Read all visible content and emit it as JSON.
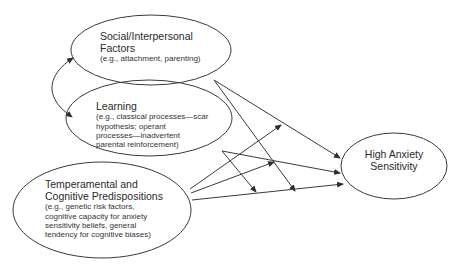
{
  "diagram": {
    "nodes": [
      {
        "id": "social",
        "title_lines": [
          "Social/Interpersonal",
          "Factors"
        ],
        "sub_lines": [
          "(e.g., attachment, parenting)"
        ]
      },
      {
        "id": "learning",
        "title_lines": [
          "Learning"
        ],
        "sub_lines": [
          "(e.g., classical processes—scar",
          "hypothesis; operant",
          "processes—inadvertent",
          "parental reinforcement)"
        ]
      },
      {
        "id": "temperamental",
        "title_lines": [
          "Temperamental and",
          "Cognitive Predispositions"
        ],
        "sub_lines": [
          "(e.g., genetic risk factors,",
          "cognitive capacity for anxiety",
          "sensitivity beliefs, general",
          "tendency for cognitive biases)"
        ]
      },
      {
        "id": "outcome",
        "title_lines": [
          "High Anxiety",
          "Sensitivity"
        ],
        "sub_lines": []
      }
    ],
    "edges": [
      {
        "from": "learning",
        "to": "social",
        "type": "bidirectional-curved"
      },
      {
        "from": "social",
        "to": "outcome"
      },
      {
        "from": "social",
        "to": "temperamental-to-outcome-path (moderation)"
      },
      {
        "from": "learning",
        "to": "outcome"
      },
      {
        "from": "learning",
        "to": "temperamental-to-outcome-path (moderation)"
      },
      {
        "from": "temperamental",
        "to": "social-to-outcome-path (moderation)"
      },
      {
        "from": "temperamental",
        "to": "learning-to-outcome-path (moderation)"
      },
      {
        "from": "temperamental",
        "to": "outcome"
      }
    ],
    "colors": {
      "stroke": "#3a3a3a",
      "background": "#ffffff",
      "text": "#2a2a2a"
    }
  }
}
